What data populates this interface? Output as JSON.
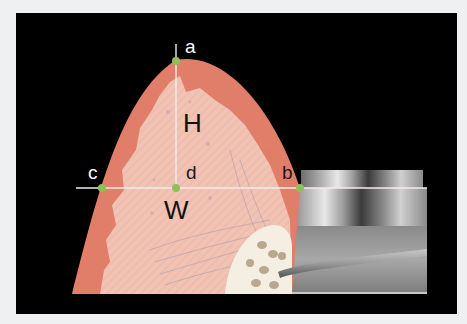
{
  "diagram": {
    "points": [
      {
        "id": "a",
        "label": "a",
        "description": "papilla tip"
      },
      {
        "id": "b",
        "label": "b",
        "description": "contact at implant crown"
      },
      {
        "id": "c",
        "label": "c",
        "description": "contact at adjacent tooth"
      },
      {
        "id": "d",
        "label": "d",
        "description": "intersection of H and W lines"
      }
    ],
    "measures": [
      {
        "id": "H",
        "label": "H",
        "description": "height from a to d"
      },
      {
        "id": "W",
        "label": "W",
        "description": "width from c to b"
      }
    ],
    "colors": {
      "background_frame": "#000000",
      "gingiva_outer": "#e07e6a",
      "gingiva_inner": "#f2c4b6",
      "point_marker": "#8fbf5a",
      "lines": "#f5ede8",
      "implant": "#9a9a9a",
      "bone": "#f2ede0"
    }
  }
}
